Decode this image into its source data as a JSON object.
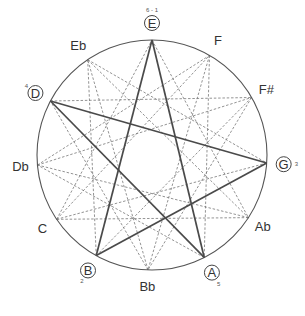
{
  "diagram": {
    "center": [
      152,
      155
    ],
    "radius": 115,
    "circle_color": "#555555",
    "dashed_color": "#777777",
    "solid_color": "#4a4a4a",
    "notes": [
      {
        "name": "E",
        "angle": 0,
        "circled": true,
        "annotation": "6 - 1"
      },
      {
        "name": "F",
        "angle": 30,
        "circled": false,
        "annotation": ""
      },
      {
        "name": "F#",
        "angle": 60,
        "circled": false,
        "annotation": ""
      },
      {
        "name": "G",
        "angle": 94,
        "circled": true,
        "annotation": "3"
      },
      {
        "name": "Ab",
        "angle": 123,
        "circled": false,
        "annotation": ""
      },
      {
        "name": "A",
        "angle": 153,
        "circled": true,
        "annotation": "5"
      },
      {
        "name": "Bb",
        "angle": 182,
        "circled": false,
        "annotation": ""
      },
      {
        "name": "B",
        "angle": 209,
        "circled": true,
        "annotation": "2"
      },
      {
        "name": "C",
        "angle": 236,
        "circled": false,
        "annotation": ""
      },
      {
        "name": "Db",
        "angle": 265,
        "circled": false,
        "annotation": ""
      },
      {
        "name": "D",
        "angle": 298,
        "circled": true,
        "annotation": "4"
      },
      {
        "name": "Eb",
        "angle": 326,
        "circled": false,
        "annotation": ""
      }
    ],
    "solid_path": [
      "E",
      "A",
      "D",
      "G",
      "B",
      "E"
    ],
    "dashed_steps": [
      4,
      5
    ]
  }
}
